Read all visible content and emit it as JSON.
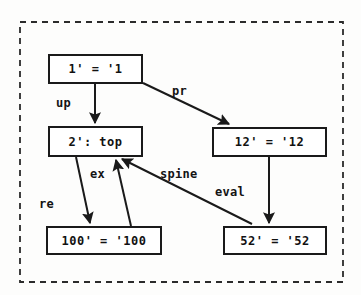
{
  "figure": {
    "frame": {
      "style": "dashed",
      "color": "#2b2b2b"
    },
    "colors": {
      "background": "#fdfdfc",
      "stroke": "#1a1a1a",
      "text": "#121212",
      "frame": "#2b2b2b"
    }
  },
  "nodes": [
    {
      "id": "n1",
      "label": "1' = '1",
      "x": 48,
      "y": 54,
      "w": 95,
      "h": 30,
      "font_size": 12
    },
    {
      "id": "n2",
      "label": "2': top",
      "x": 48,
      "y": 126,
      "w": 95,
      "h": 31,
      "font_size": 12
    },
    {
      "id": "n12",
      "label": "12' = '12",
      "x": 212,
      "y": 127,
      "w": 115,
      "h": 30,
      "font_size": 12
    },
    {
      "id": "n100",
      "label": "100' = '100",
      "x": 46,
      "y": 226,
      "w": 116,
      "h": 29,
      "font_size": 12
    },
    {
      "id": "n52",
      "label": "52' = '52",
      "x": 223,
      "y": 226,
      "w": 104,
      "h": 29,
      "font_size": 12
    }
  ],
  "edges": [
    {
      "id": "e-up",
      "label": "up",
      "from": "n1",
      "to": "n2",
      "label_x": 56,
      "label_y": 96,
      "font_size": 12
    },
    {
      "id": "e-pr",
      "label": "pr",
      "from": "n1",
      "to": "n12",
      "label_x": 172,
      "label_y": 84,
      "font_size": 12
    },
    {
      "id": "e-re",
      "label": "re",
      "from": "n2",
      "to": "n100",
      "label_x": 39,
      "label_y": 197,
      "font_size": 12
    },
    {
      "id": "e-ex",
      "label": "ex",
      "from": "n100",
      "to": "n2",
      "label_x": 90,
      "label_y": 167,
      "font_size": 12
    },
    {
      "id": "e-spine",
      "label": "spine",
      "from": "n2",
      "to": "n52",
      "label_x": 160,
      "label_y": 167,
      "font_size": 12
    },
    {
      "id": "e-eval",
      "label": "eval",
      "from": "n12",
      "to": "n52",
      "label_x": 215,
      "label_y": 185,
      "font_size": 12
    }
  ]
}
